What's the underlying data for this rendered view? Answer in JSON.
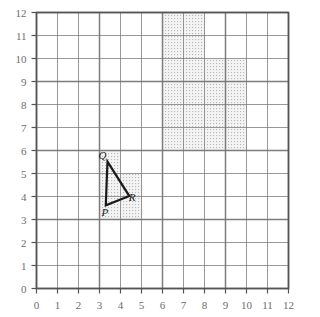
{
  "figure": {
    "grid": {
      "x_min": 0,
      "x_max": 12,
      "y_min": 0,
      "y_max": 12,
      "x_ticks": [
        "0",
        "1",
        "2",
        "3",
        "4",
        "5",
        "6",
        "7",
        "8",
        "9",
        "10",
        "11",
        "12"
      ],
      "y_ticks": [
        "0",
        "1",
        "2",
        "3",
        "4",
        "5",
        "6",
        "7",
        "8",
        "9",
        "10",
        "11",
        "12"
      ],
      "grid_on": true,
      "grid_color": "#777777",
      "border_color": "#555555",
      "tick_label_color": "#6d6d6d"
    },
    "shaded_regions": [
      {
        "name": "upper-right-tall-block",
        "x0": 6,
        "y0": 6,
        "x1": 8,
        "y1": 12
      },
      {
        "name": "upper-right-wide-block",
        "x0": 8,
        "y0": 6,
        "x1": 10,
        "y1": 10
      },
      {
        "name": "triangle-cell-left",
        "x0": 3,
        "y0": 3,
        "x1": 4,
        "y1": 6
      },
      {
        "name": "triangle-cell-right",
        "x0": 4,
        "y0": 3,
        "x1": 5,
        "y1": 5
      }
    ],
    "shading_fill": "#f2f2f2",
    "shading_dot_color": "#b4b4b4",
    "triangle": {
      "name": "triangle-PQR",
      "stroke": "#1a1a1a",
      "stroke_width": 2.2,
      "vertices": [
        {
          "label": "P",
          "x": 3.3,
          "y": 3.62
        },
        {
          "label": "Q",
          "x": 3.38,
          "y": 5.52
        },
        {
          "label": "R",
          "x": 4.42,
          "y": 4.02
        }
      ],
      "labels": [
        {
          "label": "P",
          "x": 3.28,
          "y": 3.3,
          "anchor": "label-P"
        },
        {
          "label": "Q",
          "x": 3.14,
          "y": 5.78,
          "anchor": "label-Q"
        },
        {
          "label": "R",
          "x": 4.58,
          "y": 3.92,
          "anchor": "label-R"
        }
      ]
    }
  }
}
